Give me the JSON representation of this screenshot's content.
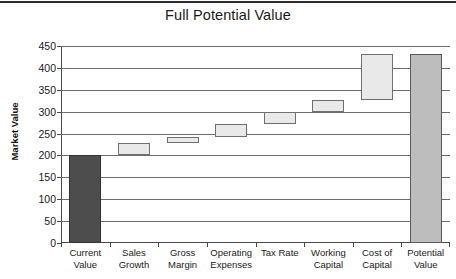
{
  "chart_data": {
    "type": "bar",
    "subtype": "waterfall",
    "title": "Full Potential Value",
    "xlabel": "",
    "ylabel": "Market Value",
    "ylim": [
      0,
      450
    ],
    "ytick_step": 50,
    "yticks": [
      450,
      400,
      350,
      300,
      250,
      200,
      150,
      100,
      50,
      0
    ],
    "grid": true,
    "legend": "none",
    "categories": [
      "Current Value",
      "Sales Growth",
      "Gross Margin",
      "Operating Expenses",
      "Tax Rate",
      "Working Capital",
      "Cost of Capital",
      "Potential Value"
    ],
    "category_lines": [
      [
        "Current",
        "Value"
      ],
      [
        "Sales",
        "Growth"
      ],
      [
        "Gross",
        "Margin"
      ],
      [
        "Operating",
        "Expenses"
      ],
      [
        "Tax Rate",
        ""
      ],
      [
        "Working",
        "Capital"
      ],
      [
        "Cost of",
        "Capital"
      ],
      [
        "Potential",
        "Value"
      ]
    ],
    "bars": [
      {
        "label": "Current Value",
        "base": 0,
        "top": 200,
        "delta": 200,
        "kind": "total",
        "color": "#4d4d4d"
      },
      {
        "label": "Sales Growth",
        "base": 200,
        "top": 228,
        "delta": 28,
        "kind": "change",
        "color": "#e9e9e9"
      },
      {
        "label": "Gross Margin",
        "base": 228,
        "top": 243,
        "delta": 15,
        "kind": "change",
        "color": "#e9e9e9"
      },
      {
        "label": "Operating Expenses",
        "base": 243,
        "top": 272,
        "delta": 29,
        "kind": "change",
        "color": "#e9e9e9"
      },
      {
        "label": "Tax Rate",
        "base": 272,
        "top": 300,
        "delta": 28,
        "kind": "change",
        "color": "#e9e9e9"
      },
      {
        "label": "Working Capital",
        "base": 300,
        "top": 327,
        "delta": 27,
        "kind": "change",
        "color": "#e9e9e9"
      },
      {
        "label": "Cost of Capital",
        "base": 327,
        "top": 432,
        "delta": 105,
        "kind": "change",
        "color": "#e9e9e9"
      },
      {
        "label": "Potential Value",
        "base": 0,
        "top": 432,
        "delta": 432,
        "kind": "total",
        "color": "#bdbdbd"
      }
    ],
    "values": [
      200,
      28,
      15,
      29,
      28,
      27,
      105,
      432
    ],
    "cumulative": [
      200,
      228,
      243,
      272,
      300,
      327,
      432,
      432
    ]
  }
}
